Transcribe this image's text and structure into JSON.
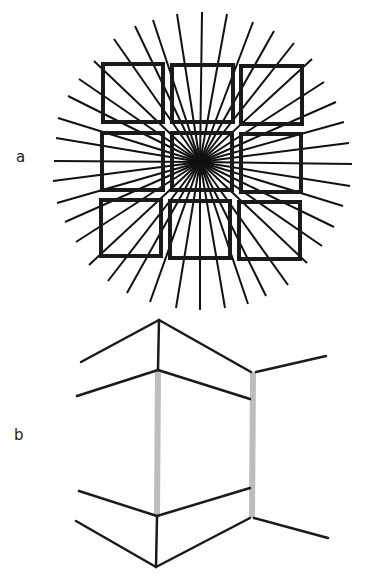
{
  "figure": {
    "panel_a": {
      "label": "a",
      "label_pos": [
        16,
        150
      ],
      "center": [
        200,
        162
      ],
      "ray_color": "#111111",
      "ray_width": 2,
      "square_color": "#1a1a1a",
      "square_width": 4,
      "ray_endpoints": [
        [
          114,
          39
        ],
        [
          135,
          26
        ],
        [
          153,
          20
        ],
        [
          177,
          14
        ],
        [
          202,
          12
        ],
        [
          227,
          14
        ],
        [
          253,
          22
        ],
        [
          274,
          31
        ],
        [
          294,
          43
        ],
        [
          312,
          59
        ],
        [
          324,
          82
        ],
        [
          336,
          102
        ],
        [
          344,
          122
        ],
        [
          349,
          143
        ],
        [
          352,
          164
        ],
        [
          350,
          186
        ],
        [
          343,
          206
        ],
        [
          334,
          227
        ],
        [
          322,
          246
        ],
        [
          307,
          263
        ],
        [
          288,
          285
        ],
        [
          266,
          296
        ],
        [
          248,
          304
        ],
        [
          225,
          308
        ],
        [
          200,
          310
        ],
        [
          176,
          308
        ],
        [
          150,
          302
        ],
        [
          127,
          293
        ],
        [
          108,
          281
        ],
        [
          89,
          265
        ],
        [
          76,
          242
        ],
        [
          65,
          222
        ],
        [
          57,
          203
        ],
        [
          53,
          181
        ],
        [
          54,
          161
        ],
        [
          56,
          138
        ],
        [
          58,
          118
        ],
        [
          68,
          96
        ],
        [
          79,
          79
        ],
        [
          94,
          61
        ]
      ],
      "squares": [
        {
          "name": "top-left",
          "x": 103,
          "y": 64,
          "w": 60,
          "h": 58
        },
        {
          "name": "top-center",
          "x": 172,
          "y": 65,
          "w": 61,
          "h": 57
        },
        {
          "name": "top-right",
          "x": 241,
          "y": 66,
          "w": 61,
          "h": 58
        },
        {
          "name": "middle-left",
          "x": 102,
          "y": 133,
          "w": 61,
          "h": 57
        },
        {
          "name": "middle-center",
          "x": 172,
          "y": 133,
          "w": 60,
          "h": 57
        },
        {
          "name": "middle-right",
          "x": 241,
          "y": 134,
          "w": 60,
          "h": 58
        },
        {
          "name": "bottom-left",
          "x": 101,
          "y": 200,
          "w": 60,
          "h": 56
        },
        {
          "name": "bottom-center",
          "x": 170,
          "y": 201,
          "w": 60,
          "h": 57
        },
        {
          "name": "bottom-right",
          "x": 239,
          "y": 202,
          "w": 61,
          "h": 57
        }
      ]
    },
    "panel_b": {
      "label": "b",
      "label_pos": [
        14,
        428
      ],
      "line_color": "#1a1a1a",
      "line_width": 2.5,
      "bar_color": "#bdbdbd",
      "bar_width": 6,
      "black_segments": [
        [
          [
            81,
            362
          ],
          [
            159,
            320
          ]
        ],
        [
          [
            159,
            320
          ],
          [
            251,
            372
          ]
        ],
        [
          [
            159,
            320
          ],
          [
            158,
            370
          ]
        ],
        [
          [
            77,
            396
          ],
          [
            158,
            370
          ]
        ],
        [
          [
            158,
            370
          ],
          [
            250,
            399
          ]
        ],
        [
          [
            256,
            372
          ],
          [
            326,
            356
          ]
        ],
        [
          [
            79,
            491
          ],
          [
            157,
            516
          ]
        ],
        [
          [
            157,
            516
          ],
          [
            250,
            488
          ]
        ],
        [
          [
            76,
            521
          ],
          [
            156,
            567
          ]
        ],
        [
          [
            157,
            517
          ],
          [
            156,
            567
          ]
        ],
        [
          [
            156,
            567
          ],
          [
            250,
            518
          ]
        ],
        [
          [
            254,
            518
          ],
          [
            328,
            538
          ]
        ]
      ],
      "gray_bars": [
        {
          "name": "left-gray-bar",
          "x1": 158,
          "y1": 371,
          "x2": 157,
          "y2": 516
        },
        {
          "name": "right-gray-bar",
          "x1": 253,
          "y1": 372,
          "x2": 252,
          "y2": 518
        }
      ]
    }
  }
}
